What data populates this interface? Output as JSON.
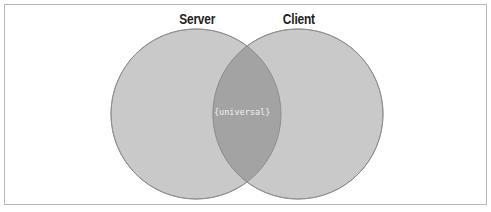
{
  "diagram": {
    "type": "venn",
    "sets": [
      {
        "label": "Server",
        "fill": "#c9c9c9"
      },
      {
        "label": "Client",
        "fill": "#c9c9c9"
      }
    ],
    "intersection": {
      "label": "{universal}",
      "fill": "#a3a3a3"
    },
    "colors": {
      "circle_fill": "#c9c9c9",
      "circle_stroke": "#9a9a9a",
      "intersection_fill": "#a3a3a3",
      "frame_border": "#b8b8b8",
      "label_text": "#222222",
      "intersection_text": "#f2f2f2"
    }
  }
}
